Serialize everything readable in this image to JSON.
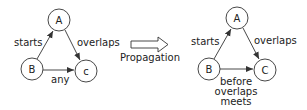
{
  "left_graph": {
    "nodes": {
      "a": "A",
      "b": "B",
      "c": "c"
    },
    "edges": {
      "b_to_a": "starts",
      "a_to_c": "overlaps",
      "b_to_c": "any"
    }
  },
  "transform": {
    "label": "Propagation",
    "arrow": "hollow-right-arrow"
  },
  "right_graph": {
    "nodes": {
      "a": "A",
      "b": "B",
      "c": "C"
    },
    "edges": {
      "b_to_a": "starts",
      "a_to_c": "overlaps",
      "b_to_c": [
        "before",
        "overlaps",
        "meets"
      ]
    }
  },
  "colors": {
    "stroke": "#333333",
    "text": "#222222",
    "background": "#ffffff"
  }
}
